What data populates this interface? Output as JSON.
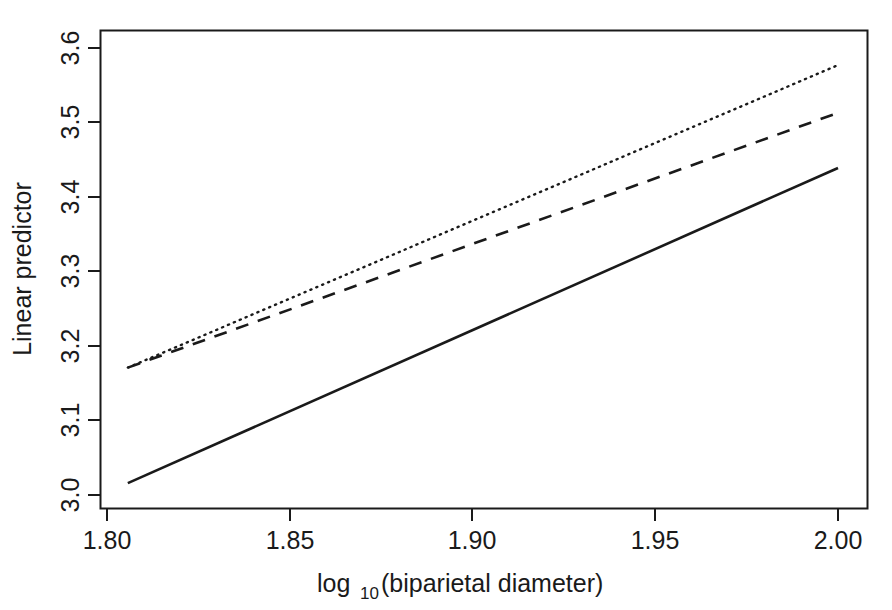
{
  "chart_data": {
    "type": "line",
    "title": "",
    "subtitle": "",
    "xlabel": "log10(biparietal diameter)",
    "xlabel_main": "log",
    "xlabel_sub": "10",
    "xlabel_rest": "(biparietal diameter)",
    "ylabel": "Linear predictor",
    "xlim": [
      1.795,
      2.005
    ],
    "ylim": [
      2.973,
      3.627
    ],
    "xticks": [
      1.8,
      1.85,
      1.9,
      1.95,
      2.0
    ],
    "xtick_labels": [
      "1.80",
      "1.85",
      "1.90",
      "1.95",
      "2.00"
    ],
    "yticks": [
      3.0,
      3.1,
      3.2,
      3.3,
      3.4,
      3.5,
      3.6
    ],
    "ytick_labels": [
      "3.0",
      "3.1",
      "3.2",
      "3.3",
      "3.4",
      "3.5",
      "3.6"
    ],
    "grid": false,
    "legend": null,
    "legend_position": "none",
    "frame": true,
    "series": [
      {
        "name": "solid-line",
        "style": "solid",
        "color": "#1a1a1a",
        "x": [
          1.8057,
          2.0
        ],
        "values": [
          3.016,
          3.439
        ]
      },
      {
        "name": "dashed-line",
        "style": "dashed",
        "color": "#1a1a1a",
        "x": [
          1.8057,
          2.0
        ],
        "values": [
          3.171,
          3.513
        ]
      },
      {
        "name": "dotted-line",
        "style": "dotted",
        "color": "#1a1a1a",
        "x": [
          1.8057,
          2.0
        ],
        "values": [
          3.171,
          3.577
        ]
      }
    ]
  },
  "axes": {
    "x_tick_0": "1.80",
    "x_tick_1": "1.85",
    "x_tick_2": "1.90",
    "x_tick_3": "1.95",
    "x_tick_4": "2.00",
    "y_tick_0": "3.0",
    "y_tick_1": "3.1",
    "y_tick_2": "3.2",
    "y_tick_3": "3.3",
    "y_tick_4": "3.4",
    "y_tick_5": "3.5",
    "y_tick_6": "3.6",
    "x_title_main": "log",
    "x_title_sub": "10",
    "x_title_rest": "(biparietal diameter)",
    "y_title": "Linear predictor"
  },
  "colors": {
    "line": "#1a1a1a",
    "axis": "#1a1a1a",
    "background": "#ffffff"
  }
}
